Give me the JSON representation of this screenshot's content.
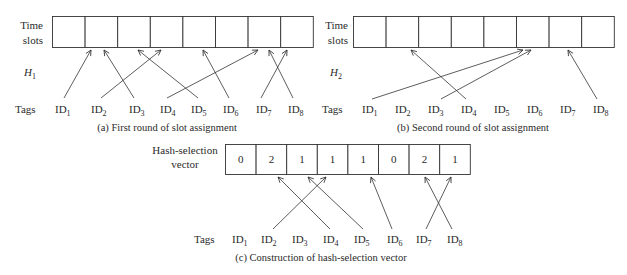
{
  "panel_a": {
    "row_label_line1": "Time",
    "row_label_line2": "slots",
    "hash_label": "H",
    "hash_sub": "1",
    "tags_label": "Tags",
    "caption": "(a)  First round of slot assignment",
    "slots": 8,
    "tags": [
      "ID",
      "ID",
      "ID",
      "ID",
      "ID",
      "ID",
      "ID",
      "ID"
    ],
    "tag_subs": [
      "1",
      "2",
      "3",
      "4",
      "5",
      "6",
      "7",
      "8"
    ],
    "mapping": {
      "ID1": 2,
      "ID2": 4,
      "ID3": 2,
      "ID4": 7,
      "ID5": 4,
      "ID6": 6,
      "ID7": 8,
      "ID8": 7
    }
  },
  "panel_b": {
    "row_label_line1": "Time",
    "row_label_line2": "slots",
    "hash_label": "H",
    "hash_sub": "2",
    "tags_label": "Tags",
    "caption": "(b)  Second round of slot assignment",
    "slots": 8,
    "tags": [
      "ID",
      "ID",
      "ID",
      "ID",
      "ID",
      "ID",
      "ID",
      "ID"
    ],
    "tag_subs": [
      "1",
      "2",
      "3",
      "4",
      "5",
      "6",
      "7",
      "8"
    ],
    "mapping": {
      "ID1": 6,
      "ID3": 6,
      "ID4": 2,
      "ID8": 7
    }
  },
  "panel_c": {
    "row_label_line1": "Hash-selection",
    "row_label_line2": "vector",
    "tags_label": "Tags",
    "caption": "(c)  Construction of hash-selection vector",
    "vector": [
      "0",
      "2",
      "1",
      "1",
      "1",
      "0",
      "2",
      "1"
    ],
    "tags": [
      "ID",
      "ID",
      "ID",
      "ID",
      "ID",
      "ID",
      "ID",
      "ID"
    ],
    "tag_subs": [
      "1",
      "2",
      "3",
      "4",
      "5",
      "6",
      "7",
      "8"
    ],
    "mapping": {
      "ID2": 4,
      "ID4": 2,
      "ID5": 3,
      "ID6": 5,
      "ID7": 8,
      "ID8": 7
    }
  }
}
